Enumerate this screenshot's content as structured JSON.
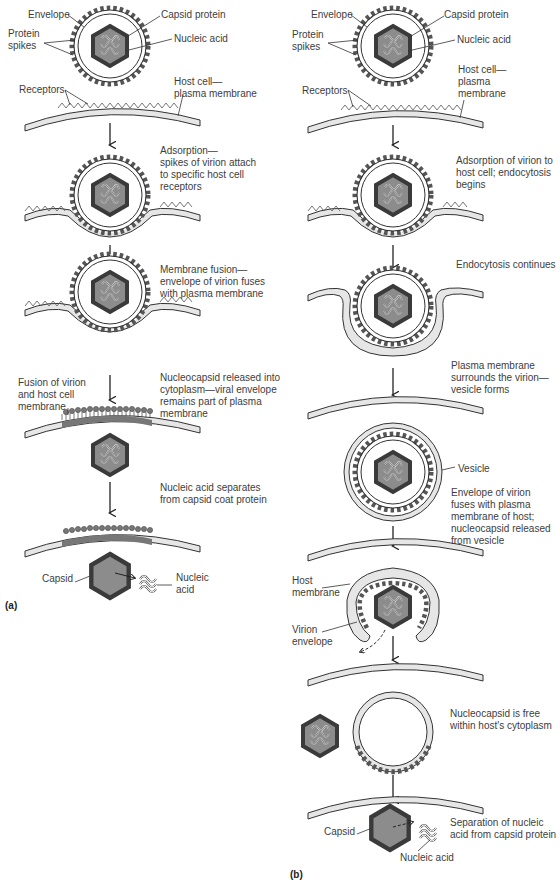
{
  "figure": {
    "panel_a": {
      "tag": "(a)",
      "labels": {
        "envelope": "Envelope",
        "capsid_protein": "Capsid protein",
        "protein_spikes": "Protein\nspikes",
        "nucleic_acid": "Nucleic acid",
        "host_membrane": "Host cell—\nplasma membrane",
        "receptors": "Receptors",
        "fusion_label": "Fusion of virion\nand host cell\nmembrane",
        "capsid": "Capsid",
        "nucleic_acid_2": "Nucleic\nacid"
      },
      "steps": [
        "Adsorption—\nspikes of virion attach\nto specific host cell\nreceptors",
        "Membrane fusion—\nenvelope of virion fuses\nwith plasma membrane",
        "Nucleocapsid released into\ncytoplasm—viral envelope\nremains part of plasma\nmembrane",
        "Nucleic acid separates\nfrom capsid coat protein"
      ]
    },
    "panel_b": {
      "tag": "(b)",
      "labels": {
        "envelope": "Envelope",
        "capsid_protein": "Capsid protein",
        "protein_spikes": "Protein\nspikes",
        "nucleic_acid": "Nucleic acid",
        "host_membrane": "Host cell—\nplasma\nmembrane",
        "receptors": "Receptors",
        "vesicle": "Vesicle",
        "host_membrane_2": "Host\nmembrane",
        "virion_envelope": "Virion\nenvelope",
        "capsid": "Capsid",
        "nucleic_acid_2": "Nucleic acid"
      },
      "steps": [
        "Adsorption of virion to\nhost cell; endocytosis\nbegins",
        "Endocytosis continues",
        "Plasma membrane\nsurrounds the virion—\nvesicle forms",
        "Envelope of virion\nfuses with plasma\nmembrane of host;\nnucleocapsid released\nfrom vesicle",
        "Nucleocapsid is free\nwithin host's cytoplasm",
        "Separation of nucleic\nacid from capsid protein"
      ]
    },
    "colors": {
      "capsid_dark": "#3a3a3a",
      "capsid_fill": "#8a8a8a",
      "membrane_fill": "#e6e6e6",
      "spike": "#6e6e6e",
      "line": "#333333"
    }
  }
}
